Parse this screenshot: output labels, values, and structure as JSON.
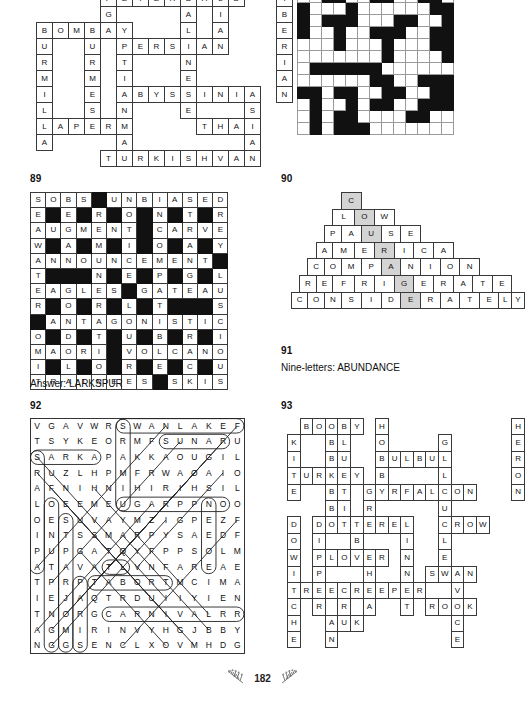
{
  "page": {
    "number": "182",
    "ornament_left": "leaf-sprig-left",
    "ornament_right": "leaf-sprig-right"
  },
  "puzzle_88_cats": {
    "number": "",
    "type": "crossword-solution",
    "cols": 16,
    "rows": 11,
    "note": "Cat breeds criss-cross solution grid (continued from previous page)",
    "rows_data": [
      [
        "",
        "",
        "",
        "",
        "P",
        "E",
        "T",
        "E",
        "R",
        "B",
        "A",
        "L",
        "D",
        "",
        "",
        "I"
      ],
      [
        "",
        "",
        "",
        "",
        "G",
        "",
        "",
        "",
        "",
        "A",
        "",
        "I",
        "",
        "",
        "",
        "B"
      ],
      [
        "B",
        "O",
        "M",
        "B",
        "A",
        "Y",
        "",
        "",
        "",
        "L",
        "",
        "A",
        "",
        "",
        "",
        "E"
      ],
      [
        "U",
        "",
        "",
        "U",
        "",
        "P",
        "E",
        "R",
        "S",
        "I",
        "A",
        "N",
        "",
        "",
        "",
        "R"
      ],
      [
        "R",
        "",
        "",
        "R",
        "",
        "T",
        "",
        "",
        "",
        "N",
        "",
        "",
        "",
        "",
        "",
        "I"
      ],
      [
        "M",
        "",
        "",
        "M",
        "",
        "I",
        "",
        "",
        "",
        "E",
        "",
        "",
        "",
        "",
        "",
        "A"
      ],
      [
        "I",
        "",
        "",
        "E",
        "",
        "A",
        "B",
        "Y",
        "S",
        "S",
        "I",
        "N",
        "I",
        "A",
        "",
        "N"
      ],
      [
        "L",
        "",
        "",
        "S",
        "",
        "N",
        "",
        "",
        "",
        "E",
        "",
        "",
        "",
        "S",
        "",
        ""
      ],
      [
        "L",
        "A",
        "P",
        "E",
        "R",
        "M",
        "",
        "",
        "",
        "",
        "T",
        "H",
        "A",
        "I",
        "",
        ""
      ],
      [
        "A",
        "",
        "",
        "",
        "",
        "A",
        "",
        "",
        "",
        "",
        "",
        "",
        "",
        "A",
        "",
        ""
      ],
      [
        "",
        "",
        "",
        "",
        "T",
        "U",
        "R",
        "K",
        "I",
        "S",
        "H",
        "V",
        "A",
        "N",
        "",
        ""
      ]
    ],
    "words": [
      "PETERBALD",
      "BOMBAY",
      "PERSIAN",
      "ABYSSINIAN",
      "LAPERM",
      "THAI",
      "TURKISHVAN",
      "EGYPTIANMAU",
      "BALINESE",
      "SIBERIAN",
      "BURMESE",
      "LIANSA"
    ]
  },
  "puzzle_pattern": {
    "type": "pattern-grid",
    "cols": 13,
    "rows": 12,
    "legend": {
      "filled": "#111111",
      "empty": "#ffffff"
    },
    "rows_data": [
      [
        0,
        0,
        1,
        1,
        0,
        0,
        1,
        1,
        0,
        0,
        1,
        1,
        0
      ],
      [
        1,
        0,
        0,
        0,
        1,
        0,
        0,
        0,
        0,
        0,
        0,
        1,
        1
      ],
      [
        1,
        0,
        1,
        1,
        1,
        0,
        0,
        0,
        1,
        1,
        0,
        0,
        1
      ],
      [
        1,
        0,
        0,
        1,
        0,
        0,
        1,
        1,
        1,
        0,
        0,
        1,
        1
      ],
      [
        0,
        0,
        0,
        1,
        0,
        0,
        0,
        1,
        0,
        0,
        0,
        1,
        1
      ],
      [
        0,
        0,
        0,
        0,
        0,
        0,
        0,
        1,
        0,
        0,
        0,
        0,
        1
      ],
      [
        0,
        1,
        1,
        1,
        1,
        1,
        1,
        0,
        0,
        0,
        0,
        0,
        0
      ],
      [
        0,
        0,
        0,
        0,
        0,
        0,
        1,
        1,
        0,
        0,
        1,
        1,
        1
      ],
      [
        1,
        1,
        0,
        1,
        1,
        0,
        0,
        1,
        1,
        0,
        0,
        1,
        1
      ],
      [
        0,
        1,
        0,
        0,
        1,
        0,
        1,
        1,
        0,
        0,
        1,
        1,
        1
      ],
      [
        0,
        1,
        0,
        1,
        1,
        0,
        0,
        0,
        0,
        1,
        1,
        0,
        0
      ],
      [
        0,
        1,
        0,
        1,
        1,
        1,
        0,
        0,
        0,
        0,
        0,
        0,
        0
      ]
    ]
  },
  "puzzle_89": {
    "number": "89",
    "type": "crossword-solution",
    "answer_label": "Answer: LARKSPUR",
    "cols": 13,
    "rows": 13,
    "rows_data": [
      [
        "S",
        "O",
        "B",
        "S",
        "#",
        "U",
        "N",
        "B",
        "I",
        "A",
        "S",
        "E",
        "D"
      ],
      [
        "E",
        "#",
        "E",
        "#",
        "R",
        "#",
        "O",
        "#",
        "N",
        "#",
        "T",
        "#",
        "R"
      ],
      [
        "A",
        "U",
        "G",
        "M",
        "E",
        "N",
        "T",
        "#",
        "C",
        "A",
        "R",
        "V",
        "E"
      ],
      [
        "W",
        "#",
        "A",
        "#",
        "M",
        "#",
        "I",
        "#",
        "O",
        "#",
        "A",
        "#",
        "Y"
      ],
      [
        "A",
        "N",
        "N",
        "O",
        "U",
        "N",
        "C",
        "E",
        "M",
        "E",
        "N",
        "T",
        "#"
      ],
      [
        "T",
        "#",
        "#",
        "#",
        "N",
        "#",
        "E",
        "#",
        "P",
        "#",
        "G",
        "#",
        "L"
      ],
      [
        "E",
        "A",
        "G",
        "L",
        "E",
        "S",
        "#",
        "G",
        "A",
        "T",
        "E",
        "A",
        "U"
      ],
      [
        "R",
        "#",
        "O",
        "#",
        "R",
        "#",
        "L",
        "#",
        "T",
        "#",
        "#",
        "#",
        "S"
      ],
      [
        "#",
        "A",
        "N",
        "T",
        "A",
        "G",
        "O",
        "N",
        "I",
        "S",
        "T",
        "I",
        "C"
      ],
      [
        "O",
        "#",
        "D",
        "#",
        "T",
        "#",
        "U",
        "#",
        "B",
        "#",
        "R",
        "#",
        "I"
      ],
      [
        "M",
        "A",
        "O",
        "R",
        "I",
        "#",
        "V",
        "O",
        "L",
        "C",
        "A",
        "N",
        "O"
      ],
      [
        "I",
        "#",
        "L",
        "#",
        "O",
        "#",
        "R",
        "#",
        "E",
        "#",
        "C",
        "#",
        "U"
      ],
      [
        "T",
        "R",
        "A",
        "I",
        "N",
        "E",
        "E",
        "S",
        "#",
        "S",
        "K",
        "I",
        "S"
      ]
    ]
  },
  "puzzle_90": {
    "number": "90",
    "type": "word-pyramid",
    "shaded_column_word": "COURAGED",
    "rows_data": [
      {
        "word": "C",
        "indent": 7,
        "shaded_index": 0
      },
      {
        "word": "LOW",
        "indent": 6,
        "shaded_index": 1
      },
      {
        "word": "PAUSE",
        "indent": 5,
        "shaded_index": 2
      },
      {
        "word": "AMERICA",
        "indent": 4,
        "shaded_index": 3
      },
      {
        "word": "COMPANION",
        "indent": 3,
        "shaded_index": 4
      },
      {
        "word": "REFRIGERATE",
        "indent": 2,
        "shaded_index": 5
      },
      {
        "word": "CONSIDERATELY",
        "indent": 1,
        "shaded_index": 6
      }
    ]
  },
  "puzzle_91": {
    "number": "91",
    "label": "Nine-letters: ABUNDANCE"
  },
  "puzzle_92": {
    "number": "92",
    "type": "word-search-solution",
    "cols": 17,
    "rows": 15,
    "rows_data": [
      "VGAVWRSWANLAKEF",
      "TSYKEORMFSUNARU",
      "SARKAPAKKAOUGIL",
      "RUZLHPMFRWAOAIO",
      "AFNIHNIHIRIHSIL",
      "LOEEMEUGARPPNOO",
      "OESUVAYMZIGPEZF",
      "INTSSMARPYSAEDF",
      "PUPGATQYFPPSOLM",
      "ATAVATLVNFAREAE",
      "TPRPTABORTMCIMA",
      "IEJAQTRDUIIYIEN",
      "TNORGCARNIVALRR",
      "AGMIRINVYHGJBBY",
      "NGGSENCLXOVMHDG"
    ],
    "found_words": [
      "SWANLAKE",
      "SUN",
      "SARKA",
      "CARNIVAL",
      "TABOR",
      "ESCAPES",
      "PARADE",
      "ROMEO",
      "FESTIVAL",
      "ALTAR"
    ]
  },
  "puzzle_93": {
    "number": "93",
    "type": "crossword-solution",
    "cols": 19,
    "rows": 14,
    "rows_data": [
      [
        "",
        "B",
        "O",
        "O",
        "B",
        "Y",
        "",
        "H",
        "",
        "",
        "",
        "",
        "",
        "",
        "",
        "",
        "",
        "",
        "H"
      ],
      [
        "K",
        "",
        "",
        "B",
        "L",
        "",
        "",
        "O",
        "",
        "",
        "",
        "",
        "G",
        "",
        "",
        "",
        "",
        "",
        "E"
      ],
      [
        "I",
        "",
        "",
        "B",
        "U",
        "",
        "",
        "B",
        "U",
        "L",
        "B",
        "U",
        "L",
        "",
        "",
        "",
        "",
        "",
        "R"
      ],
      [
        "T",
        "U",
        "R",
        "K",
        "E",
        "Y",
        "",
        "B",
        "",
        "",
        "",
        "",
        "L",
        "",
        "",
        "",
        "",
        "",
        "O"
      ],
      [
        "E",
        "",
        "",
        "B",
        "T",
        "",
        "G",
        "Y",
        "R",
        "F",
        "A",
        "L",
        "C",
        "O",
        "N",
        "",
        "",
        "",
        "N"
      ],
      [
        "",
        "",
        "",
        "B",
        "I",
        "",
        "R",
        "",
        "",
        "",
        "",
        "",
        "U",
        "",
        "",
        "",
        "",
        "",
        ""
      ],
      [
        "D",
        "",
        "D",
        "O",
        "T",
        "T",
        "E",
        "R",
        "E",
        "L",
        "",
        "",
        "C",
        "R",
        "O",
        "W",
        "",
        "",
        ""
      ],
      [
        "O",
        "",
        "I",
        "",
        "",
        "B",
        "",
        "",
        "",
        "I",
        "",
        "",
        "L",
        "",
        "",
        "",
        "",
        "",
        ""
      ],
      [
        "W",
        "",
        "P",
        "L",
        "O",
        "V",
        "E",
        "R",
        "",
        "N",
        "",
        "",
        "E",
        "",
        "",
        "",
        "",
        "",
        ""
      ],
      [
        "I",
        "",
        "P",
        "",
        "",
        "",
        "H",
        "",
        "",
        "N",
        "",
        "S",
        "W",
        "A",
        "N",
        "",
        "",
        "",
        ""
      ],
      [
        "T",
        "R",
        "E",
        "E",
        "C",
        "R",
        "E",
        "E",
        "P",
        "E",
        "R",
        "",
        "",
        "V",
        "",
        "",
        "",
        "",
        ""
      ],
      [
        "C",
        "",
        "R",
        "",
        "R",
        "",
        "A",
        "",
        "",
        "T",
        "",
        "R",
        "O",
        "O",
        "K",
        "",
        "",
        "",
        ""
      ],
      [
        "H",
        "",
        "",
        "A",
        "U",
        "K",
        "",
        "",
        "",
        "",
        "",
        "",
        "",
        "C",
        "",
        "",
        "",
        "",
        ""
      ],
      [
        "E",
        "",
        "",
        "N",
        "",
        "",
        "",
        "",
        "",
        "",
        "",
        "",
        "",
        "E",
        "",
        "",
        "",
        "",
        ""
      ]
    ],
    "words": [
      "BOOBY",
      "TURKEY",
      "BULBUL",
      "GYRFALCON",
      "DOTTEREL",
      "CROW",
      "PLOVER",
      "SWAN",
      "TREECREEPER",
      "ROOK",
      "AUK",
      "SHEARWATER",
      "HERON",
      "KITE",
      "DOWITCHER",
      "BLUETIT",
      "PIPER",
      "CRANE",
      "LINNET",
      "WREN"
    ]
  },
  "puzzle_93_bottom": {
    "word": "SHEARWATER"
  }
}
